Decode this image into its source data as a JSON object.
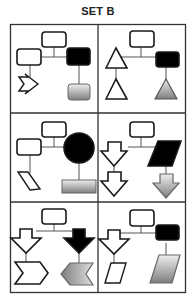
{
  "title": "SET B",
  "colors": {
    "stroke": "#1a1a1a",
    "fill_white": "#ffffff",
    "fill_black": "#000000",
    "gradient_top": "#eeeeee",
    "gradient_bottom": "#808080",
    "border": "#333333"
  },
  "grid": {
    "rows": 3,
    "cols": 2,
    "panels": [
      {
        "id": 1,
        "row": 1,
        "col": 1,
        "shapes": [
          "top: white rounded rect",
          "left: white rounded rect",
          "right: black rounded rect",
          "bottom-left: white star-arrow (notched arrow)",
          "bottom-right: gradient rounded rect"
        ]
      },
      {
        "id": 2,
        "row": 1,
        "col": 2,
        "shapes": [
          "top: white rounded rect",
          "left: white triangle",
          "right: black rounded rect",
          "bottom-left: white triangle",
          "bottom-right: gradient triangle"
        ]
      },
      {
        "id": 3,
        "row": 2,
        "col": 1,
        "shapes": [
          "top: white rounded rect",
          "left: white rounded rect",
          "right: black circle",
          "bottom-left: white parallelogram",
          "bottom-right: gradient rectangle"
        ]
      },
      {
        "id": 4,
        "row": 2,
        "col": 2,
        "shapes": [
          "top: white rounded rect",
          "left: white down arrow",
          "right: black parallelogram",
          "bottom-left: white down arrow",
          "bottom-right: gradient down arrow"
        ]
      },
      {
        "id": 5,
        "row": 3,
        "col": 1,
        "shapes": [
          "top: white rounded rect",
          "left: white down arrow",
          "right: black down arrow",
          "bottom-left: white chevron right",
          "bottom-right: gradient chevron left"
        ]
      },
      {
        "id": 6,
        "row": 3,
        "col": 2,
        "shapes": [
          "top: white rounded rect",
          "left: white down arrow",
          "right: black rounded rect",
          "bottom-left: white parallelogram",
          "bottom-right: gradient parallelogram"
        ]
      }
    ]
  }
}
